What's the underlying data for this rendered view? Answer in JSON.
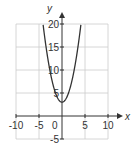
{
  "chart_data": {
    "type": "line",
    "title": "",
    "xlabel": "x",
    "ylabel": "y",
    "xlim": [
      -10,
      10
    ],
    "ylim": [
      -5,
      20
    ],
    "grid": true,
    "x_ticks": [
      -10,
      -5,
      0,
      5,
      10
    ],
    "y_ticks": [
      -5,
      5,
      10,
      15,
      20
    ],
    "x_tick_labels": [
      "-10",
      "-5",
      "0",
      "5",
      "10"
    ],
    "y_tick_labels": [
      "-5",
      "5",
      "10",
      "15",
      "20"
    ],
    "origin_label": "0",
    "series": [
      {
        "name": "y = x^2 + 3",
        "x": [
          -4.1,
          -4,
          -3,
          -2,
          -1,
          0,
          1,
          2,
          3,
          4,
          4.1
        ],
        "values": [
          19.81,
          19,
          12,
          7,
          4,
          3,
          4,
          7,
          12,
          19,
          19.81
        ]
      }
    ],
    "colors": {
      "curve": "#333333",
      "axis": "#333333",
      "grid": "#cccccc"
    }
  }
}
